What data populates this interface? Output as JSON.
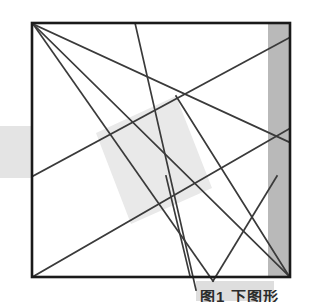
{
  "figure": {
    "title_fragment": "图1 下图形",
    "background_color": "#ffffff",
    "line_color": "#3a3a3a",
    "frame_color": "#1a1a1a",
    "shade_light": "#eaeaea",
    "shade_mid": "#dcdcdc",
    "shade_band": "#b9b9b9",
    "frame": {
      "label": "outer-square-frame",
      "x": 32,
      "y": 23,
      "width": 258,
      "height": 254,
      "stroke_width": 2.6
    },
    "right_band": {
      "label": "right-vertical-gray-band",
      "x": 268,
      "y": 24,
      "width": 21,
      "height": 252,
      "fill": "#b9b9b9"
    },
    "left_patch": {
      "label": "left-edge-gray-patch",
      "x": 0,
      "y": 126,
      "width": 33,
      "height": 52,
      "fill": "#e4e4e4"
    },
    "bottom_patch": {
      "label": "bottom-caption-gray-patch",
      "x": 196,
      "y": 281,
      "width": 78,
      "height": 20,
      "fill": "#dedede"
    },
    "center_quad": {
      "label": "center-tilted-shaded-square",
      "points": "176,96 212,188 131,224 96,133",
      "fill": "#e9e9e9"
    },
    "lines": [
      {
        "name": "diagonal-tl-to-br",
        "x1": 33,
        "y1": 24,
        "x2": 289,
        "y2": 276
      },
      {
        "name": "tl-to-right-upper",
        "x1": 33,
        "y1": 24,
        "x2": 289,
        "y2": 142
      },
      {
        "name": "tl-to-bottom-mid",
        "x1": 33,
        "y1": 24,
        "x2": 213,
        "y2": 281
      },
      {
        "name": "top-mid-to-bottom-mid",
        "x1": 135,
        "y1": 23,
        "x2": 196,
        "y2": 290
      },
      {
        "name": "left-mid-to-top-right",
        "x1": 33,
        "y1": 176,
        "x2": 289,
        "y2": 38
      },
      {
        "name": "bottom-left-to-right-upper",
        "x1": 34,
        "y1": 276,
        "x2": 289,
        "y2": 129
      },
      {
        "name": "center-to-bottom-right",
        "x1": 176,
        "y1": 96,
        "x2": 289,
        "y2": 276
      },
      {
        "name": "short-stub-center-down",
        "x1": 166,
        "y1": 176,
        "x2": 190,
        "y2": 276
      },
      {
        "name": "short-stub-right-down-left",
        "x1": 277,
        "y1": 176,
        "x2": 213,
        "y2": 281
      }
    ]
  }
}
